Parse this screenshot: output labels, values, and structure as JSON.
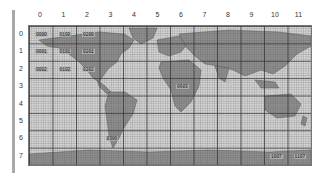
{
  "grid": {
    "columns": [
      "0",
      "1",
      "2",
      "3",
      "4",
      "5",
      "6",
      "7",
      "8",
      "9",
      "10",
      "11"
    ],
    "rows": [
      "0",
      "1",
      "2",
      "3",
      "4",
      "5",
      "6",
      "7"
    ]
  },
  "tiles": [
    {
      "label": "0000",
      "col": 0,
      "row": 0
    },
    {
      "label": "0100",
      "col": 1,
      "row": 0
    },
    {
      "label": "0200",
      "col": 2,
      "row": 0
    },
    {
      "label": "0001",
      "col": 0,
      "row": 1
    },
    {
      "label": "0101",
      "col": 1,
      "row": 1
    },
    {
      "label": "0201",
      "col": 2,
      "row": 1
    },
    {
      "label": "0002",
      "col": 0,
      "row": 2
    },
    {
      "label": "0102",
      "col": 1,
      "row": 2
    },
    {
      "label": "0202",
      "col": 2,
      "row": 2
    },
    {
      "label": "0603",
      "col": 6,
      "row": 3
    },
    {
      "label": "0306",
      "col": 3,
      "row": 6
    },
    {
      "label": "1007",
      "col": 10,
      "row": 7
    },
    {
      "label": "1107",
      "col": 11,
      "row": 7
    }
  ],
  "colors": {
    "ocean": "#d4d4d4",
    "land": "#8e8e8e",
    "grid": "#333333"
  }
}
